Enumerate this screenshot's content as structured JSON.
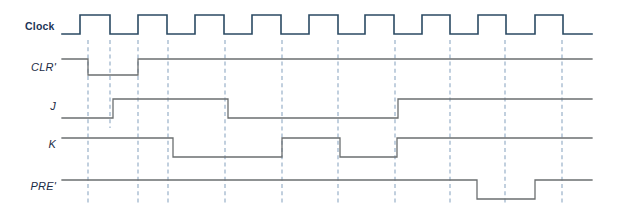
{
  "diagram": {
    "type": "digital-timing-waveform",
    "background_color": "#ffffff",
    "clock_color": "#2b4a63",
    "signal_color": "#6b6f70",
    "gridline_color": "#8fa9c4",
    "label_color": "#1d3557",
    "time_axis": {
      "start_x": 62,
      "end_x": 592,
      "clock_period_px": 57,
      "first_rise_x": 80
    },
    "gridlines_x": [
      88,
      110,
      138,
      168,
      225,
      282,
      338,
      395,
      450,
      505,
      562
    ],
    "signals": [
      {
        "name": "clock",
        "label": "Clock",
        "label_x": 25,
        "label_y": 30,
        "italic": false,
        "high_y": 15,
        "low_y": 34,
        "color": "#2b4a63",
        "transitions_x": [
          80,
          110,
          138,
          167,
          195,
          224,
          252,
          281,
          309,
          338,
          365,
          394,
          422,
          450,
          478,
          506,
          535,
          563
        ],
        "start_level": "low",
        "points": "62,34 80,34 80,15 110,15 110,34 138,34 138,15 167,15 167,34 195,34 195,15 224,15 224,34 252,34 252,15 281,15 281,34 309,34 309,15 338,15 338,34 365,34 365,15 394,15 394,34 422,34 422,15 450,15 450,34 478,34 478,15 506,15 506,34 535,34 535,15 563,15 563,34 592,34"
      },
      {
        "name": "clr",
        "label": "CLR'",
        "label_x": 29,
        "label_y": 71,
        "italic": true,
        "high_y": 59,
        "low_y": 75,
        "color": "#6b6f70",
        "start_level": "high",
        "points": "62,59 88,59 88,75 138,75 138,59 592,59"
      },
      {
        "name": "j",
        "label": "J",
        "label_x": 48,
        "label_y": 110,
        "italic": true,
        "high_y": 99,
        "low_y": 118,
        "color": "#6b6f70",
        "start_level": "low",
        "points": "62,118 113,118 113,99 228,99 228,118 398,118 398,99 592,99"
      },
      {
        "name": "k",
        "label": "K",
        "label_x": 46,
        "label_y": 148,
        "italic": true,
        "high_y": 138,
        "low_y": 157,
        "color": "#6b6f70",
        "start_level": "high",
        "points": "62,138 173,138 173,157 282,157 282,138 340,138 340,157 397,157 397,138 592,138"
      },
      {
        "name": "pre",
        "label": "PRE'",
        "label_x": 25,
        "label_y": 190,
        "italic": true,
        "high_y": 180,
        "low_y": 199,
        "color": "#6b6f70",
        "start_level": "high",
        "points": "62,180 477,180 477,199 535,199 535,180 592,180"
      }
    ]
  }
}
